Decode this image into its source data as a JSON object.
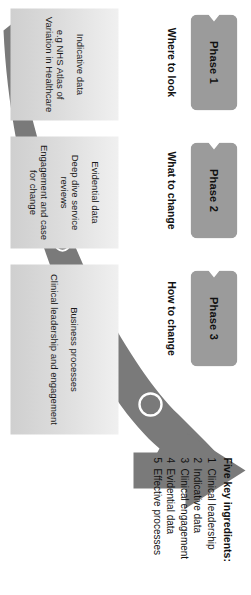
{
  "diagram": {
    "arrow_color": "#7a7a7a",
    "phase_box_color": "#9b9b9b",
    "panel_gradient_from": "#f0f0f0",
    "panel_gradient_to": "#cfcfcf",
    "marker_color": "#ffffff"
  },
  "phases": [
    {
      "label": "Phase 1",
      "caption": "Where to look",
      "lines": [
        "Indicative\ndata",
        "e.g NHS Atlas of\nVariation in Healthcare"
      ]
    },
    {
      "label": "Phase 2",
      "caption": "What to change",
      "lines": [
        "Evidential\ndata",
        "Deep dive service\nreviews",
        "Engagement and case\nfor change"
      ]
    },
    {
      "label": "Phase 3",
      "caption": "How to change",
      "lines": [
        "Business processes",
        "Clinical leadership\nand engagement"
      ]
    }
  ],
  "panel1": {
    "line1": "Indicative data",
    "line2": "e.g NHS Atlas of Variation in Healthcare"
  },
  "panel2": {
    "line1": "Evidential data",
    "line2": "Deep dive service reviews",
    "line3": "Engagement and case for change"
  },
  "panel3": {
    "line1": "Business processes",
    "line2": "Clinical leadership and engagement"
  },
  "ingredients": {
    "title": "Five key ingredients:",
    "items": [
      {
        "num": "1",
        "text": "Clinical leadership"
      },
      {
        "num": "2",
        "text": "Indicative data"
      },
      {
        "num": "3",
        "text": "Clinical engagement"
      },
      {
        "num": "4",
        "text": "Evidential data"
      },
      {
        "num": "5",
        "text": "Effective processes"
      }
    ]
  },
  "markers": {
    "marker1_label": "phase-1-milestone",
    "marker2_label": "phase-2-milestone",
    "marker3_label": "phase-3-milestone"
  }
}
